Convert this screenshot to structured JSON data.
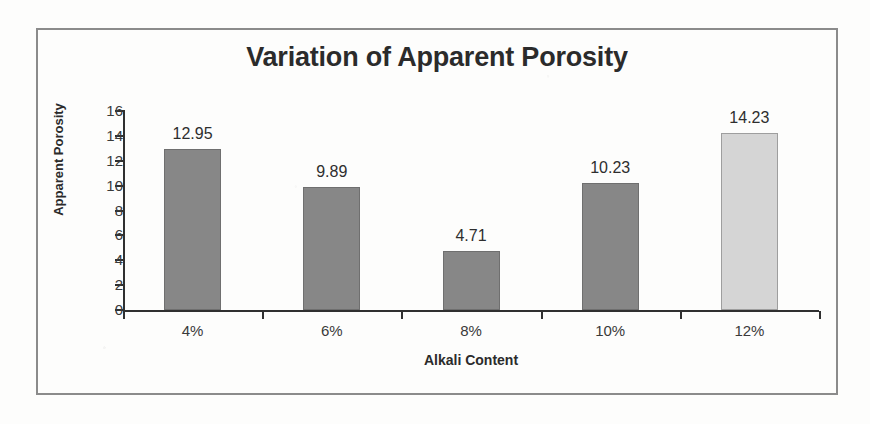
{
  "chart_data": {
    "type": "bar",
    "title": "Variation of Apparent Porosity",
    "xlabel": "Alkali Content",
    "ylabel": "Apparent Porosity",
    "categories": [
      "4%",
      "6%",
      "8%",
      "10%",
      "12%"
    ],
    "values": [
      12.95,
      9.89,
      4.71,
      10.23,
      14.23
    ],
    "value_labels": [
      "12.95",
      "9.89",
      "4.71",
      "10.23",
      "14.23"
    ],
    "ylim": [
      0,
      16
    ],
    "ytick_labels": [
      "0",
      "2",
      "4",
      "6",
      "8",
      "10",
      "12",
      "14",
      "16"
    ],
    "ytick_values": [
      0,
      2,
      4,
      6,
      8,
      10,
      12,
      14,
      16
    ],
    "grid": false,
    "legend": false,
    "bar_colors": [
      "#878787",
      "#878787",
      "#878787",
      "#878787",
      "#d5d5d5"
    ],
    "series": [
      {
        "name": "Apparent Porosity",
        "values": [
          12.95,
          9.89,
          4.71,
          10.23,
          14.23
        ]
      }
    ]
  },
  "style": {
    "frame_border_color": "#8b8b8b",
    "axis_color": "#303030",
    "text_color": "#2b2b2b",
    "bar_dark": "#878787",
    "bar_light": "#d5d5d5",
    "background": "#fdfdfc"
  }
}
